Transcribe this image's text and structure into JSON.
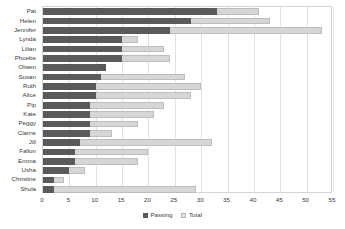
{
  "chart_data": {
    "type": "bar",
    "orientation": "horizontal",
    "overlap": true,
    "title": "",
    "subtitle": "",
    "xlabel": "",
    "ylabel": "",
    "xlim": [
      0,
      55
    ],
    "xticks": [
      0,
      5,
      10,
      15,
      20,
      25,
      30,
      35,
      40,
      45,
      50,
      55
    ],
    "grid": "vertical",
    "legend_position": "bottom",
    "categories": [
      "Pat",
      "Helen",
      "Jennifer",
      "Lynda",
      "Lilian",
      "Phoebe",
      "Olwen",
      "Susan",
      "Ruth",
      "Alice",
      "Pip",
      "Kate",
      "Peggy",
      "Clarrie",
      "Jill",
      "Fallon",
      "Emma",
      "Usha",
      "Christine",
      "Shula"
    ],
    "series": [
      {
        "name": "Passing",
        "color": "#5a5a5a",
        "values": [
          33,
          28,
          24,
          15,
          15,
          15,
          12,
          11,
          10,
          10,
          9,
          9,
          9,
          9,
          7,
          6,
          6,
          5,
          2,
          2
        ]
      },
      {
        "name": "Total",
        "color": "#d6d6d6",
        "values": [
          41,
          43,
          53,
          18,
          23,
          24,
          12,
          27,
          30,
          28,
          23,
          21,
          18,
          13,
          32,
          20,
          18,
          8,
          4,
          29
        ]
      }
    ]
  },
  "legend": {
    "items": [
      {
        "label": "Passing",
        "swatch": "passing-swatch-icon"
      },
      {
        "label": "Total",
        "swatch": "total-swatch-icon"
      }
    ]
  }
}
